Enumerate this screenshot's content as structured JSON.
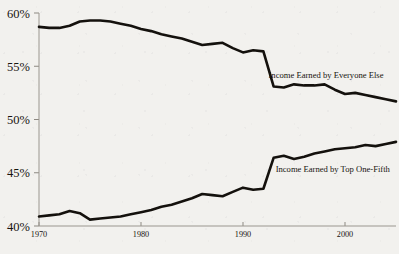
{
  "chart_data": {
    "type": "line",
    "title": "",
    "subtitle": "",
    "xlabel": "",
    "ylabel": "",
    "xlim": [
      1970,
      2005
    ],
    "ylim": [
      40,
      60
    ],
    "grid": false,
    "legend_position": "inline-annotation",
    "y_ticks": [
      "60%",
      "55%",
      "50%",
      "45%",
      "40%"
    ],
    "y_tick_values": [
      60,
      55,
      50,
      45,
      40
    ],
    "x_ticks": [
      "1970",
      "1980",
      "1990",
      "2000"
    ],
    "x_tick_values": [
      1970,
      1980,
      1990,
      2000
    ],
    "x": [
      1970,
      1971,
      1972,
      1973,
      1974,
      1975,
      1976,
      1977,
      1978,
      1979,
      1980,
      1981,
      1982,
      1983,
      1984,
      1985,
      1986,
      1987,
      1988,
      1989,
      1990,
      1991,
      1992,
      1993,
      1994,
      1995,
      1996,
      1997,
      1998,
      1999,
      2000,
      2001,
      2002,
      2003,
      2004,
      2005
    ],
    "series": [
      {
        "name": "Income Earned by Everyone Else",
        "label": "Income Earned by Everyone Else",
        "label_x": 1992.5,
        "label_y": 53.9,
        "color": "#14110d",
        "values": [
          58.7,
          58.6,
          58.6,
          58.8,
          59.2,
          59.3,
          59.3,
          59.2,
          59.0,
          58.8,
          58.5,
          58.3,
          58.0,
          57.8,
          57.6,
          57.3,
          57.0,
          57.1,
          57.2,
          56.7,
          56.3,
          56.5,
          56.4,
          53.1,
          53.0,
          53.3,
          53.2,
          53.2,
          53.3,
          52.8,
          52.4,
          52.5,
          52.3,
          52.1,
          51.9,
          51.7
        ]
      },
      {
        "name": "Income Earned by Top One-Fifth",
        "label": "Income Earned by Top One-Fifth",
        "label_x": 1993.2,
        "label_y": 45.1,
        "color": "#14110d",
        "values": [
          40.9,
          41.0,
          41.1,
          41.4,
          41.2,
          40.6,
          40.7,
          40.8,
          40.9,
          41.1,
          41.3,
          41.5,
          41.8,
          42.0,
          42.3,
          42.6,
          43.0,
          42.9,
          42.8,
          43.2,
          43.6,
          43.4,
          43.5,
          46.4,
          46.6,
          46.3,
          46.5,
          46.8,
          47.0,
          47.2,
          47.3,
          47.4,
          47.6,
          47.5,
          47.7,
          47.9
        ]
      }
    ]
  },
  "figure": {
    "background_color": "#f2f1ee",
    "axis_color": "#9a968f",
    "line_color": "#14110d"
  }
}
